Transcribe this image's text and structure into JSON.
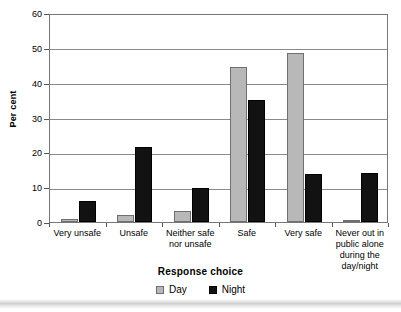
{
  "chart_data": {
    "type": "bar",
    "title": "",
    "subtitle": "",
    "xlabel": "Response choice",
    "ylabel": "Per cent",
    "ylim": [
      0,
      60
    ],
    "ytick_step": 10,
    "yticks": [
      "0",
      "10",
      "20",
      "30",
      "40",
      "50",
      "60"
    ],
    "grid": true,
    "legend_position": "bottom",
    "categories": [
      "Very unsafe",
      "Unsafe",
      "Neither safe\nnor unsafe",
      "Safe",
      "Very safe",
      "Never out in\npublic alone\nduring the\nday/night"
    ],
    "category_lines": [
      [
        "Very unsafe"
      ],
      [
        "Unsafe"
      ],
      [
        "Neither safe",
        "nor unsafe"
      ],
      [
        "Safe"
      ],
      [
        "Very safe"
      ],
      [
        "Never out in",
        "public alone",
        "during the",
        "day/night"
      ]
    ],
    "series": [
      {
        "name": "Day",
        "color": "#b8b8b8",
        "values": [
          1.0,
          2.0,
          3.2,
          44.5,
          48.5,
          0.5
        ]
      },
      {
        "name": "Night",
        "color": "#121212",
        "values": [
          6.0,
          21.5,
          9.7,
          35.0,
          13.8,
          14.0
        ]
      }
    ]
  },
  "colors": {
    "day": "#b8b8b8",
    "night": "#121212",
    "gridline": "#8a8a8a",
    "axis": "#777777",
    "text": "#000000"
  }
}
